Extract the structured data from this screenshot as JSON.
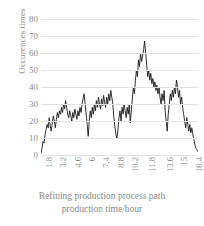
{
  "chart_data": {
    "type": "line",
    "title": "",
    "subtitle": "",
    "xlabel": "Refining production process path production time/hour",
    "xlabel_line1": "Refining production process path",
    "xlabel_line2": "production time/hour",
    "ylabel": "Occurences times",
    "ylim": [
      0,
      80
    ],
    "xlim": [
      1.8,
      17.1
    ],
    "ytick_labels": [
      "80",
      "70",
      "60",
      "50",
      "40",
      "30",
      "20",
      "10",
      "0"
    ],
    "ytick_values": [
      80,
      70,
      60,
      50,
      40,
      30,
      20,
      10,
      0
    ],
    "xtick_labels": [
      "1.8",
      "3.2",
      "4.6",
      "6",
      "7.4",
      "8.8",
      "10.2",
      "11.8",
      "13.6",
      "15",
      "16.4"
    ],
    "xtick_values": [
      1.8,
      3.2,
      4.6,
      6,
      7.4,
      8.8,
      10.2,
      11.8,
      13.6,
      15,
      16.4
    ],
    "grid": "horizontal",
    "legend": "none",
    "line_color": "#1a1a1a",
    "grid_color": "#e2e2e2",
    "text_color": "#8a8a8a",
    "background_color": "#ffffff",
    "series": [
      {
        "name": "Occurences times",
        "x": [
          1.8,
          1.9,
          2.0,
          2.1,
          2.2,
          2.3,
          2.4,
          2.5,
          2.6,
          2.7,
          2.8,
          2.9,
          3.0,
          3.1,
          3.2,
          3.3,
          3.4,
          3.5,
          3.6,
          3.7,
          3.8,
          3.9,
          4.0,
          4.1,
          4.2,
          4.3,
          4.4,
          4.5,
          4.6,
          4.7,
          4.8,
          4.9,
          5.0,
          5.1,
          5.2,
          5.3,
          5.4,
          5.5,
          5.6,
          5.7,
          5.8,
          5.9,
          6.0,
          6.1,
          6.2,
          6.3,
          6.4,
          6.5,
          6.6,
          6.7,
          6.8,
          6.9,
          7.0,
          7.1,
          7.2,
          7.3,
          7.4,
          7.5,
          7.6,
          7.7,
          7.8,
          7.9,
          8.0,
          8.1,
          8.2,
          8.3,
          8.4,
          8.5,
          8.6,
          8.7,
          8.8,
          8.9,
          9.0,
          9.1,
          9.2,
          9.3,
          9.4,
          9.5,
          9.6,
          9.7,
          9.8,
          9.9,
          10.0,
          10.1,
          10.2,
          10.3,
          10.4,
          10.5,
          10.6,
          10.7,
          10.8,
          10.9,
          11.0,
          11.1,
          11.2,
          11.3,
          11.4,
          11.5,
          11.6,
          11.7,
          11.8,
          11.9,
          12.0,
          12.1,
          12.2,
          12.3,
          12.4,
          12.5,
          12.6,
          12.7,
          12.8,
          12.9,
          13.0,
          13.1,
          13.2,
          13.3,
          13.4,
          13.5,
          13.6,
          13.7,
          13.8,
          13.9,
          14.0,
          14.1,
          14.2,
          14.3,
          14.4,
          14.5,
          14.6,
          14.7,
          14.8,
          14.9,
          15.0,
          15.1,
          15.2,
          15.3,
          15.4,
          15.5,
          15.6,
          15.7,
          15.8,
          15.9,
          16.0,
          16.1,
          16.2,
          16.3,
          16.4,
          16.5,
          16.6,
          16.7,
          16.8,
          16.9,
          17.0,
          17.1
        ],
        "values": [
          1,
          4,
          8,
          7,
          12,
          15,
          18,
          16,
          22,
          17,
          14,
          19,
          23,
          20,
          16,
          21,
          25,
          22,
          26,
          24,
          28,
          25,
          30,
          27,
          32,
          28,
          24,
          22,
          26,
          23,
          20,
          25,
          22,
          27,
          24,
          21,
          26,
          23,
          28,
          25,
          30,
          33,
          36,
          30,
          24,
          18,
          11,
          20,
          26,
          22,
          28,
          24,
          30,
          26,
          32,
          28,
          34,
          30,
          27,
          33,
          29,
          35,
          31,
          28,
          34,
          30,
          36,
          32,
          38,
          34,
          30,
          22,
          17,
          12,
          10,
          15,
          22,
          26,
          20,
          28,
          24,
          30,
          26,
          22,
          28,
          24,
          30,
          19,
          26,
          33,
          40,
          36,
          44,
          50,
          46,
          56,
          52,
          60,
          55,
          58,
          62,
          67,
          60,
          53,
          46,
          50,
          44,
          48,
          42,
          45,
          40,
          43,
          38,
          41,
          36,
          40,
          34,
          30,
          36,
          32,
          38,
          26,
          20,
          14,
          24,
          30,
          36,
          32,
          38,
          34,
          40,
          36,
          44,
          40,
          34,
          38,
          30,
          34,
          28,
          24,
          20,
          16,
          22,
          18,
          14,
          18,
          13,
          16,
          12,
          9,
          6,
          4,
          3,
          2
        ]
      }
    ]
  }
}
